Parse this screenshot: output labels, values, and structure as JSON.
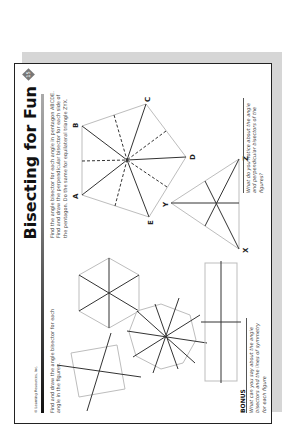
{
  "page": {
    "publisher": "© Learning Resources, Inc.",
    "title": "Bisecting for Fun",
    "page_number": "15"
  },
  "left_section": {
    "instruction": "Find and draw the angle bisector for each angle in the figures.",
    "figures": [
      "square",
      "regular hexagon",
      "regular octagon",
      "rectangle"
    ]
  },
  "right_section": {
    "instruction": "Find the angle bisector for each angle in pentagon ABCDE. Find and draw the perpendicular bisector for each side of the pentagon. Do the same for equilateral triangle ZYX.",
    "pentagon_labels": [
      "A",
      "B",
      "C",
      "D",
      "E"
    ],
    "triangle_labels": [
      "X",
      "Y",
      "Z"
    ],
    "question": "What do you notice about the angle and perpendicular bisectors of the figures?"
  },
  "bonus": {
    "title": "BONUS",
    "question": "What can you say about the angle bisectors and the lines of symmetry for each figure"
  },
  "colors": {
    "figure_outline": "#bdbdbd",
    "bisector_line": "#333333",
    "shadow": "#d6d6d6"
  }
}
